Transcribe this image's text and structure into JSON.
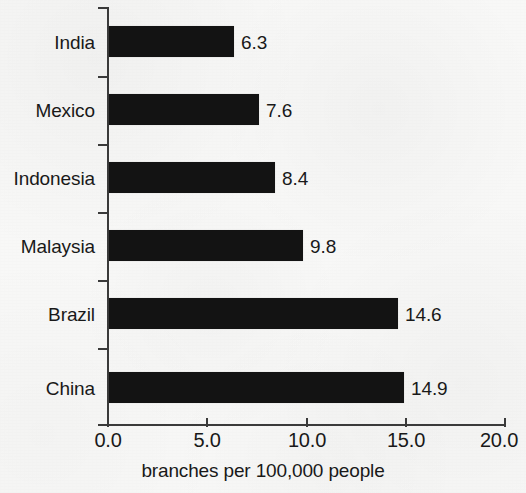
{
  "chart_data": {
    "type": "bar",
    "orientation": "horizontal",
    "title": "",
    "subtitle": "",
    "xlabel": "branches per 100,000 people",
    "ylabel": "",
    "categories": [
      "India",
      "Mexico",
      "Indonesia",
      "Malaysia",
      "Brazil",
      "China"
    ],
    "values": [
      6.3,
      7.6,
      8.4,
      9.8,
      14.6,
      14.9
    ],
    "value_labels": [
      "6.3",
      "7.6",
      "8.4",
      "9.8",
      "14.6",
      "14.9"
    ],
    "xlim": [
      0.0,
      20.0
    ],
    "xticks": [
      0.0,
      5.0,
      10.0,
      15.0,
      20.0
    ],
    "xtick_labels": [
      "0.0",
      "5.0",
      "10.0",
      "15.0",
      "20.0"
    ],
    "grid": false,
    "legend": null,
    "bar_color": "#131313",
    "axis_color": "#3a3a3a",
    "text_color": "#191919",
    "background_color": "#f7f7f6",
    "data_label_position": "outside-end",
    "ytick_style": "between-categories",
    "annotations": []
  }
}
